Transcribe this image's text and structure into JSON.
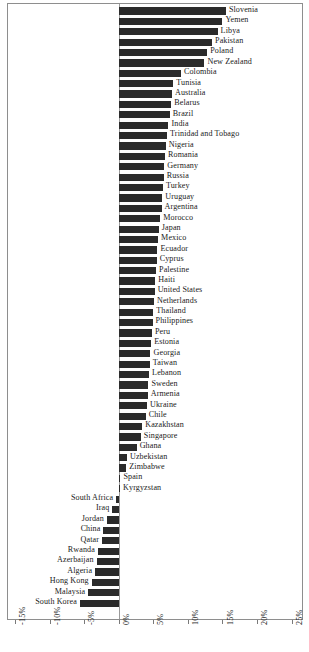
{
  "chart_data": {
    "type": "bar",
    "orientation": "horizontal",
    "title": "",
    "subtitle": "",
    "xlabel": "",
    "ylabel": "",
    "xlim": [
      -16.0,
      26.5
    ],
    "grid": false,
    "legend": null,
    "axis": {
      "tick_values": [
        -15,
        -10,
        -5,
        0,
        5,
        10,
        15,
        20,
        25
      ],
      "tick_labels": [
        "-15%",
        "-10%",
        "-5%",
        "0%",
        "5%",
        "10%",
        "15%",
        "20%",
        "25%"
      ]
    },
    "value_unit": "percent",
    "categories": [
      "Slovenia",
      "Yemen",
      "Libya",
      "Pakistan",
      "Poland",
      "New Zealand",
      "Colombia",
      "Tunisia",
      "Australia",
      "Belarus",
      "Brazil",
      "India",
      "Trinidad and Tobago",
      "Nigeria",
      "Romania",
      "Germany",
      "Russia",
      "Turkey",
      "Uruguay",
      "Argentina",
      "Morocco",
      "Japan",
      "Mexico",
      "Ecuador",
      "Cyprus",
      "Palestine",
      "Haiti",
      "United States",
      "Netherlands",
      "Thailand",
      "Philippines",
      "Peru",
      "Estonia",
      "Georgia",
      "Taiwan",
      "Lebanon",
      "Sweden",
      "Armenia",
      "Ukraine",
      "Chile",
      "Kazakhstan",
      "Singapore",
      "Ghana",
      "Uzbekistan",
      "Zimbabwe",
      "Spain",
      "Kyrgyzstan",
      "South Africa",
      "Iraq",
      "Jordan",
      "China",
      "Qatar",
      "Rwanda",
      "Azerbaijan",
      "Algeria",
      "Hong Kong",
      "Malaysia",
      "South Korea"
    ],
    "values": [
      15.5,
      15.0,
      14.3,
      13.5,
      12.8,
      12.4,
      9.0,
      7.9,
      7.7,
      7.6,
      7.4,
      7.2,
      7.0,
      6.8,
      6.7,
      6.6,
      6.5,
      6.4,
      6.3,
      6.2,
      6.0,
      5.8,
      5.7,
      5.6,
      5.5,
      5.4,
      5.3,
      5.2,
      5.1,
      5.0,
      4.9,
      4.8,
      4.7,
      4.6,
      4.5,
      4.4,
      4.3,
      4.2,
      4.1,
      3.9,
      3.4,
      3.2,
      2.6,
      1.2,
      1.1,
      0.25,
      0.2,
      -0.35,
      -0.9,
      -1.7,
      -2.2,
      -2.4,
      -3.0,
      -3.2,
      -3.4,
      -3.9,
      -4.4,
      -5.6
    ],
    "bar_color": "#2b2b2b",
    "series_name": ""
  }
}
